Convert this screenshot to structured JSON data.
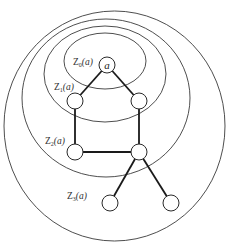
{
  "diagram": {
    "type": "nested-neighborhoods-graph",
    "root_node_label": "a",
    "zones": [
      {
        "id": "Z0",
        "prefix": "Z",
        "subscript": "0",
        "arg": "(a)",
        "text": "Z0(a)"
      },
      {
        "id": "Z1",
        "prefix": "Z",
        "subscript": "1",
        "arg": "(a)",
        "text": "Z1(a)"
      },
      {
        "id": "Z2",
        "prefix": "Z",
        "subscript": "2",
        "arg": "(a)",
        "text": "Z2(a)"
      },
      {
        "id": "Z3",
        "prefix": "Z",
        "subscript": "3",
        "arg": "(a)",
        "text": "Z3(a)"
      }
    ],
    "nodes": [
      {
        "id": "a",
        "zone": "Z0",
        "label": "a"
      },
      {
        "id": "z1_left",
        "zone": "Z1",
        "label": ""
      },
      {
        "id": "z1_right",
        "zone": "Z1",
        "label": ""
      },
      {
        "id": "z2_left",
        "zone": "Z2",
        "label": ""
      },
      {
        "id": "z2_right",
        "zone": "Z2",
        "label": ""
      },
      {
        "id": "z3_left",
        "zone": "Z3",
        "label": ""
      },
      {
        "id": "z3_right",
        "zone": "Z3",
        "label": ""
      }
    ],
    "edges": [
      [
        "a",
        "z1_left"
      ],
      [
        "a",
        "z1_right"
      ],
      [
        "z1_left",
        "z2_left"
      ],
      [
        "z1_right",
        "z2_right"
      ],
      [
        "z2_left",
        "z2_right"
      ],
      [
        "z2_right",
        "z3_left"
      ],
      [
        "z2_right",
        "z3_right"
      ]
    ],
    "colors": {
      "stroke": "#2a2a2a",
      "background": "#ffffff"
    }
  }
}
